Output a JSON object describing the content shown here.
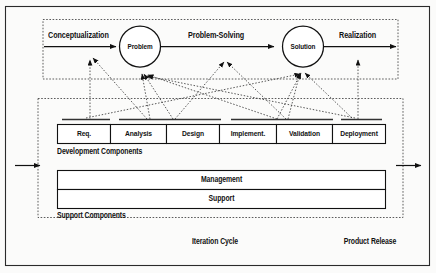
{
  "figure": {
    "title_visible": false,
    "colors": {
      "background": "#fbfbfa",
      "stroke": "#1a1a1a",
      "box_fill": "#ffffff",
      "dashed_stroke": "#555555"
    }
  },
  "top_flow": {
    "arrows": [
      {
        "label": "Conceptualization"
      },
      {
        "label": "Problem-Solving"
      },
      {
        "label": "Realization"
      }
    ],
    "nodes": [
      {
        "label": "Problem"
      },
      {
        "label": "Solution"
      }
    ]
  },
  "development": {
    "caption": "Development Components",
    "cells": [
      {
        "label": "Req."
      },
      {
        "label": "Analysis"
      },
      {
        "label": "Design"
      },
      {
        "label": "Implement."
      },
      {
        "label": "Validation"
      },
      {
        "label": "Deployment"
      }
    ]
  },
  "support": {
    "caption": "Support Components",
    "bands": [
      {
        "label": "Management"
      },
      {
        "label": "Support"
      }
    ]
  },
  "footer": {
    "left_label": "Iteration Cycle",
    "right_label": "Product Release"
  }
}
